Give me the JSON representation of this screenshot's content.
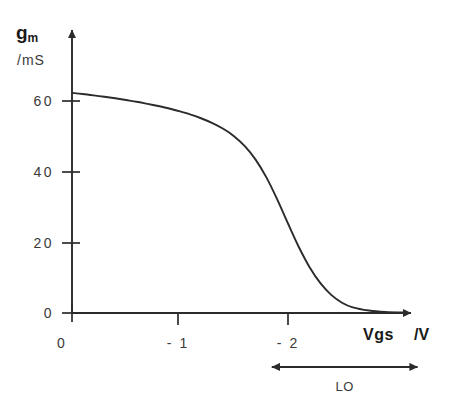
{
  "chart_data": {
    "type": "line",
    "title": "",
    "xlabel": "Vgs",
    "xunit": "/V",
    "ylabel": "g",
    "ylabel_subscript": "m",
    "yunit": "/mS",
    "xlim": [
      0,
      -3.2
    ],
    "ylim": [
      0,
      88
    ],
    "grid": false,
    "legend": null,
    "x_ticklabels": [
      "0",
      "- 1",
      "- 2"
    ],
    "x_tickvalues": [
      0,
      -1,
      -2
    ],
    "y_ticklabels": [
      "60",
      "40",
      "20",
      "0"
    ],
    "y_tickvalues": [
      60,
      40,
      20,
      0
    ],
    "series": [
      {
        "name": "transconductance",
        "x": [
          0.0,
          -0.1,
          -0.2,
          -0.3,
          -0.4,
          -0.5,
          -0.6,
          -0.7,
          -0.8,
          -0.9,
          -1.0,
          -1.1,
          -1.2,
          -1.3,
          -1.4,
          -1.5,
          -1.6,
          -1.7,
          -1.8,
          -1.9,
          -2.0,
          -2.1,
          -2.2,
          -2.3,
          -2.4,
          -2.5,
          -2.6,
          -2.75,
          -2.9,
          -3.1
        ],
        "y": [
          62.0,
          61.7,
          61.3,
          60.9,
          60.5,
          60.0,
          59.5,
          58.9,
          58.3,
          57.6,
          56.8,
          55.9,
          54.8,
          53.5,
          51.9,
          49.8,
          47.0,
          43.2,
          38.2,
          32.0,
          25.2,
          18.6,
          12.9,
          8.4,
          5.1,
          2.9,
          1.6,
          0.7,
          0.3,
          0.1
        ]
      }
    ],
    "annotations": [
      {
        "name": "LO",
        "label": "LO",
        "type": "double-headed-arrow",
        "x_start": -1.85,
        "x_end": -3.2
      }
    ]
  },
  "axes": {
    "y_arrow_label": "g",
    "y_arrow_sub": "m",
    "y_unit_label": "/mS",
    "x_sym_label": "Vgs",
    "x_unit_label": "/V"
  }
}
